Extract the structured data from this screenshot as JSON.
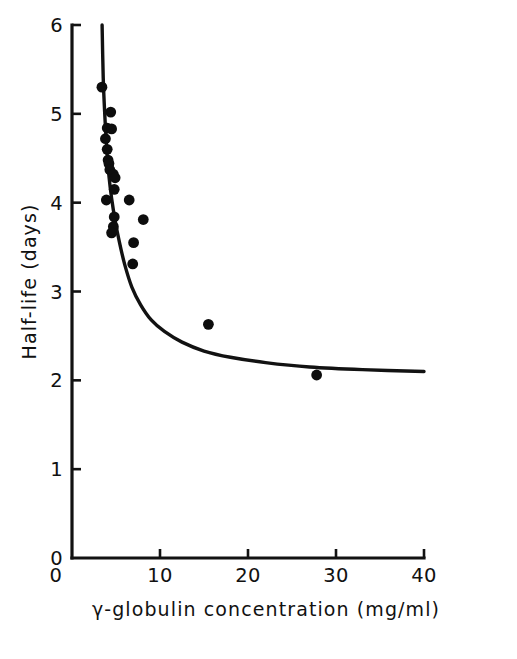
{
  "chart_data": {
    "type": "scatter",
    "title": "",
    "xlabel": "γ-globulin concentration (mg/ml)",
    "ylabel": "Half-life (days)",
    "xlim": [
      0,
      40
    ],
    "ylim": [
      0,
      6
    ],
    "grid": false,
    "legend": null,
    "x_ticks": [
      {
        "value": 0,
        "label": "0"
      },
      {
        "value": 10,
        "label": "10"
      },
      {
        "value": 20,
        "label": "20"
      },
      {
        "value": 30,
        "label": "30"
      },
      {
        "value": 40,
        "label": "40"
      }
    ],
    "y_ticks": [
      {
        "value": 0,
        "label": "0"
      },
      {
        "value": 1,
        "label": "1"
      },
      {
        "value": 2,
        "label": "2"
      },
      {
        "value": 3,
        "label": "3"
      },
      {
        "value": 4,
        "label": "4"
      },
      {
        "value": 5,
        "label": "5"
      },
      {
        "value": 6,
        "label": "6"
      }
    ],
    "series": [
      {
        "name": "observations",
        "marker": "filled-circle",
        "color": "#0d0d0d",
        "points": [
          {
            "x": 3.4,
            "y": 5.3
          },
          {
            "x": 4.4,
            "y": 5.02
          },
          {
            "x": 4.0,
            "y": 4.84
          },
          {
            "x": 4.5,
            "y": 4.83
          },
          {
            "x": 3.8,
            "y": 4.72
          },
          {
            "x": 4.0,
            "y": 4.6
          },
          {
            "x": 4.1,
            "y": 4.48
          },
          {
            "x": 4.2,
            "y": 4.44
          },
          {
            "x": 4.3,
            "y": 4.37
          },
          {
            "x": 4.7,
            "y": 4.32
          },
          {
            "x": 4.9,
            "y": 4.28
          },
          {
            "x": 4.8,
            "y": 4.15
          },
          {
            "x": 3.9,
            "y": 4.03
          },
          {
            "x": 6.5,
            "y": 4.03
          },
          {
            "x": 4.8,
            "y": 3.84
          },
          {
            "x": 8.1,
            "y": 3.81
          },
          {
            "x": 4.7,
            "y": 3.73
          },
          {
            "x": 4.5,
            "y": 3.66
          },
          {
            "x": 7.0,
            "y": 3.55
          },
          {
            "x": 6.9,
            "y": 3.31
          },
          {
            "x": 15.5,
            "y": 2.63
          },
          {
            "x": 27.8,
            "y": 2.06
          }
        ]
      }
    ],
    "fit_curve": {
      "name": "fitted hyperbolic curve",
      "color": "#121212",
      "description": "Decaying curve asymptoting toward a half-life of about 2.1 days",
      "asymptote_y": 2.1,
      "points": [
        {
          "x": 3.42,
          "y": 6.0
        },
        {
          "x": 3.55,
          "y": 5.4
        },
        {
          "x": 3.72,
          "y": 5.0
        },
        {
          "x": 3.95,
          "y": 4.6
        },
        {
          "x": 4.2,
          "y": 4.3
        },
        {
          "x": 4.5,
          "y": 4.05
        },
        {
          "x": 4.9,
          "y": 3.8
        },
        {
          "x": 5.4,
          "y": 3.55
        },
        {
          "x": 6.0,
          "y": 3.3
        },
        {
          "x": 6.8,
          "y": 3.05
        },
        {
          "x": 7.8,
          "y": 2.85
        },
        {
          "x": 9.0,
          "y": 2.68
        },
        {
          "x": 10.5,
          "y": 2.55
        },
        {
          "x": 12.5,
          "y": 2.43
        },
        {
          "x": 15.0,
          "y": 2.33
        },
        {
          "x": 18.0,
          "y": 2.26
        },
        {
          "x": 22.0,
          "y": 2.2
        },
        {
          "x": 27.0,
          "y": 2.15
        },
        {
          "x": 33.0,
          "y": 2.12
        },
        {
          "x": 40.0,
          "y": 2.1
        }
      ]
    }
  },
  "figure": {
    "background_color": "#ffffff",
    "ink_color": "#121212"
  }
}
